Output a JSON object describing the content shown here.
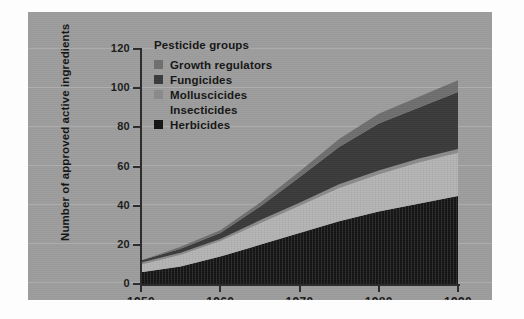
{
  "figure": {
    "background_color": "#fdfdfd",
    "panel_color": "#9c9c9c"
  },
  "legend": {
    "title": "Pesticide groups",
    "position": "inside-top-left",
    "items": [
      {
        "label": "Growth regulators",
        "color": "#6e6e6e",
        "swatch_visible": true
      },
      {
        "label": "Fungicides",
        "color": "#3a3a3a",
        "swatch_visible": true
      },
      {
        "label": "Molluscicides",
        "color": "#8a8a8a",
        "swatch_visible": true
      },
      {
        "label": "Insecticides",
        "color": "#b4b4b4",
        "swatch_visible": false
      },
      {
        "label": "Herbicides",
        "color": "#141414",
        "swatch_visible": true
      }
    ]
  },
  "chart_data": {
    "type": "area",
    "stacked": true,
    "title": "",
    "subtitle": "",
    "xlabel": "",
    "ylabel": "Number of approved active ingredients",
    "xlim": [
      1950,
      1990
    ],
    "ylim": [
      0,
      120
    ],
    "ytick_values": [
      0,
      20,
      40,
      60,
      80,
      100,
      120
    ],
    "ytick_labels": [
      "0",
      "20",
      "40",
      "60",
      "80",
      "100",
      "120"
    ],
    "xtick_values": [
      1950,
      1960,
      1970,
      1980,
      1990
    ],
    "xtick_labels": [
      "1950",
      "1960",
      "1970",
      "1980",
      "1990"
    ],
    "grid": false,
    "x": [
      1950,
      1955,
      1960,
      1965,
      1970,
      1975,
      1980,
      1985,
      1990
    ],
    "stack_order_bottom_to_top": [
      "Herbicides",
      "Insecticides",
      "Molluscicides",
      "Fungicides",
      "Growth regulators"
    ],
    "series": [
      {
        "name": "Herbicides",
        "color": "#141414",
        "values": [
          6,
          9,
          14,
          20,
          26,
          32,
          37,
          41,
          45
        ]
      },
      {
        "name": "Insecticides",
        "color": "#b4b4b4",
        "values": [
          4,
          6,
          8,
          11,
          14,
          17,
          19,
          21,
          22
        ]
      },
      {
        "name": "Molluscicides",
        "color": "#8a8a8a",
        "values": [
          1,
          1,
          1,
          1.5,
          1.5,
          2,
          2,
          2,
          2
        ]
      },
      {
        "name": "Fungicides",
        "color": "#3a3a3a",
        "values": [
          1,
          2,
          3,
          7,
          13,
          19,
          24,
          26,
          29
        ]
      },
      {
        "name": "Growth regulators",
        "color": "#6e6e6e",
        "values": [
          0,
          1,
          1.5,
          2,
          3,
          4,
          5,
          5.5,
          6
        ]
      }
    ],
    "cumulative_totals": [
      12,
      19,
      27.5,
      41.5,
      57.5,
      74,
      87,
      95.5,
      104
    ],
    "annotations": []
  }
}
